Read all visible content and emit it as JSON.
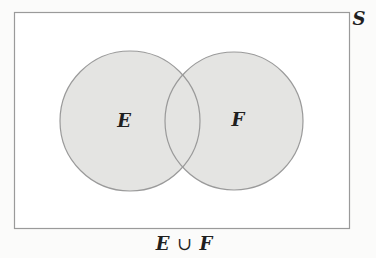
{
  "diagram": {
    "type": "venn",
    "universe": {
      "label": "S",
      "rect": {
        "x": 14,
        "y": 12,
        "width": 335,
        "height": 216
      }
    },
    "sets": [
      {
        "label": "E",
        "cx": 130,
        "cy": 121,
        "r": 70
      },
      {
        "label": "F",
        "cx": 234,
        "cy": 121,
        "r": 69
      }
    ],
    "shaded_region": "E ∪ F",
    "caption": {
      "set_a": "E",
      "operator": "∪",
      "set_b": "F"
    }
  },
  "colors": {
    "background": "#fbfbfa",
    "universe_fill": "#ffffff",
    "universe_stroke": "#9a9a9a",
    "set_fill": "#e4e4e2",
    "set_stroke": "#9a9a9a",
    "text": "#1f1f1f"
  }
}
